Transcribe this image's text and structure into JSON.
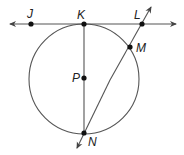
{
  "diagram": {
    "colors": {
      "stroke": "#444444",
      "point": "#111111",
      "background": "#ffffff"
    },
    "circle": {
      "center_label": "P",
      "cx": 84,
      "cy": 79,
      "r": 55
    },
    "points": [
      {
        "id": "J",
        "label": "J",
        "x": 31,
        "y": 24
      },
      {
        "id": "K",
        "label": "K",
        "x": 84,
        "y": 24
      },
      {
        "id": "L",
        "label": "L",
        "x": 142,
        "y": 24
      },
      {
        "id": "M",
        "label": "M",
        "x": 130,
        "y": 47
      },
      {
        "id": "P",
        "label": "P",
        "x": 84,
        "y": 78
      },
      {
        "id": "N",
        "label": "N",
        "x": 84,
        "y": 133
      }
    ],
    "lines": [
      {
        "id": "tangent-JL",
        "description": "Line through J, K, L tangent to circle at K"
      },
      {
        "id": "secant-LN",
        "description": "Line through L, M, N"
      },
      {
        "id": "diameter-KN",
        "description": "Segment K to N through P"
      }
    ]
  }
}
